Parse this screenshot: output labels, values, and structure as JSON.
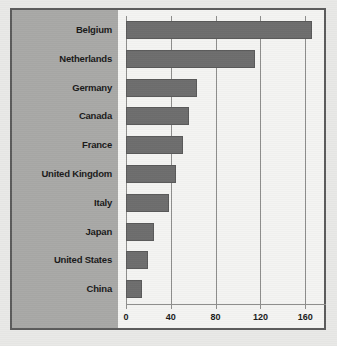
{
  "chart_data": {
    "type": "bar",
    "orientation": "horizontal",
    "title": "",
    "xlabel": "",
    "ylabel": "",
    "categories": [
      "Belgium",
      "Netherlands",
      "Germany",
      "Canada",
      "France",
      "United Kingdom",
      "Italy",
      "Japan",
      "United States",
      "China"
    ],
    "values": [
      166,
      115,
      63,
      56,
      51,
      45,
      38,
      25,
      20,
      14
    ],
    "xlim": [
      0,
      175
    ],
    "xticks": [
      0,
      40,
      80,
      120,
      160
    ],
    "xtick_labels": [
      "0",
      "40",
      "80",
      "120",
      "160"
    ],
    "grid": "vertical",
    "legend": "none",
    "bar_color": "#6e6e6e",
    "panel_color": "#a9a9a7",
    "plot_background": "#f4f4f2",
    "axis_color": "#8e8e8c",
    "frame_color": "#5c5c5c"
  }
}
